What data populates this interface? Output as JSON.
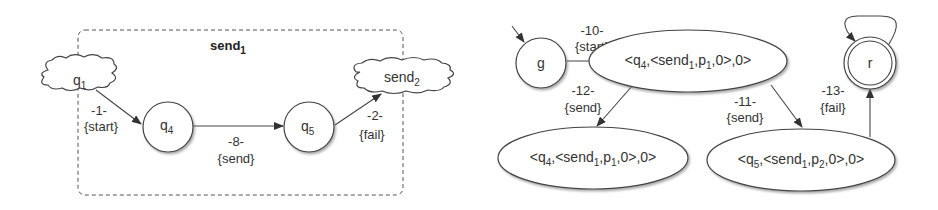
{
  "left_diagram": {
    "container": {
      "label": "send",
      "label_sub": "1",
      "style": "dashed-rounded-box"
    },
    "nodes": [
      {
        "id": "q1",
        "shape": "cloud",
        "label": "q",
        "sub": "1"
      },
      {
        "id": "q4",
        "shape": "circle",
        "label": "q",
        "sub": "4"
      },
      {
        "id": "q5",
        "shape": "circle",
        "label": "q",
        "sub": "5"
      },
      {
        "id": "send2",
        "shape": "cloud",
        "label": "send",
        "sub": "2"
      }
    ],
    "edges": [
      {
        "from": "q1",
        "to": "q4",
        "num": "-1-",
        "action": "{start}"
      },
      {
        "from": "q4",
        "to": "q5",
        "num": "-8-",
        "action": "{send}"
      },
      {
        "from": "q5",
        "to": "send2",
        "num": "-2-",
        "action": "{fail}"
      }
    ]
  },
  "right_diagram": {
    "nodes": [
      {
        "id": "g",
        "shape": "circle",
        "label": "g",
        "initial": true
      },
      {
        "id": "top",
        "shape": "ellipse",
        "pre": "<q",
        "s1": "4",
        "mid": ",<send",
        "s2": "1",
        "mid2": ",p",
        "s3": "1",
        "post": ",0>,0>"
      },
      {
        "id": "bl",
        "shape": "ellipse",
        "pre": "<q",
        "s1": "4",
        "mid": ",<send",
        "s2": "1",
        "mid2": ",p",
        "s3": "1",
        "post": ",0>,0>"
      },
      {
        "id": "br",
        "shape": "ellipse",
        "pre": "<q",
        "s1": "5",
        "mid": ",<send",
        "s2": "1",
        "mid2": ",p",
        "s3": "2",
        "post": ",0>,0>"
      },
      {
        "id": "r",
        "shape": "double-circle",
        "label": "r",
        "self_loop": true
      }
    ],
    "edges": [
      {
        "from": "g",
        "to": "top",
        "num": "-10-",
        "action": "{start}"
      },
      {
        "from": "top",
        "to": "bl",
        "num": "-12-",
        "action": "{send}"
      },
      {
        "from": "top",
        "to": "br",
        "num": "-11-",
        "action": "{send}"
      },
      {
        "from": "br",
        "to": "r",
        "num": "-13-",
        "action": "{fail}"
      }
    ]
  }
}
